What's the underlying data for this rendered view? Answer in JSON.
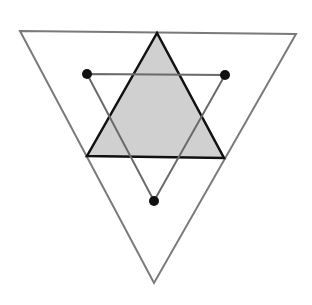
{
  "diagram": {
    "colors": {
      "background": "#ffffff",
      "outer_stroke": "#7a7a7a",
      "shaded_fill": "#d0d0d0",
      "shaded_stroke": "#111111",
      "inner_stroke": "#6a6a6a",
      "point_fill": "#111111"
    },
    "outer_triangle": {
      "points": [
        [
          20,
          31
        ],
        [
          296,
          34
        ],
        [
          154,
          283
        ]
      ]
    },
    "shaded_triangle": {
      "points": [
        [
          157,
          33
        ],
        [
          87,
          156
        ],
        [
          224,
          158
        ]
      ]
    },
    "inner_triangle": {
      "points": [
        [
          87,
          74
        ],
        [
          225,
          75
        ],
        [
          154,
          201
        ]
      ]
    },
    "marked_points": [
      {
        "x": 87,
        "y": 74
      },
      {
        "x": 225,
        "y": 75
      },
      {
        "x": 154,
        "y": 201
      }
    ]
  }
}
